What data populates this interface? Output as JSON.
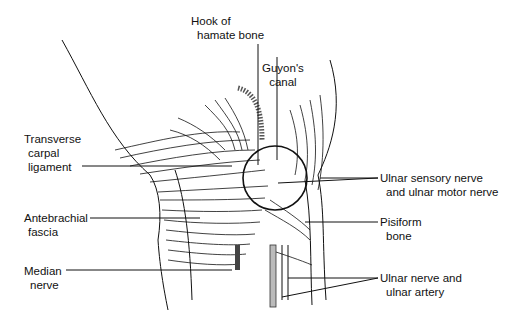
{
  "diagram": {
    "labels": {
      "hook_hamate": {
        "line1": "Hook of",
        "line2": "hamate bone"
      },
      "guyon": {
        "line1": "Guyon's",
        "line2": "canal"
      },
      "transverse": {
        "line1": "Transverse",
        "line2": "carpal",
        "line3": "ligament"
      },
      "antebrachial": {
        "line1": "Antebrachial",
        "line2": "fascia"
      },
      "median": {
        "line1": "Median",
        "line2": "nerve"
      },
      "ulnar_sensory": {
        "line1": "Ulnar sensory nerve",
        "line2": "and ulnar motor nerve"
      },
      "pisiform": {
        "line1": "Pisiform",
        "line2": "bone"
      },
      "ulnar_nerve_artery": {
        "line1": "Ulnar nerve and",
        "line2": "ulnar artery"
      }
    },
    "colors": {
      "ink": "#111111",
      "background": "#ffffff"
    }
  }
}
